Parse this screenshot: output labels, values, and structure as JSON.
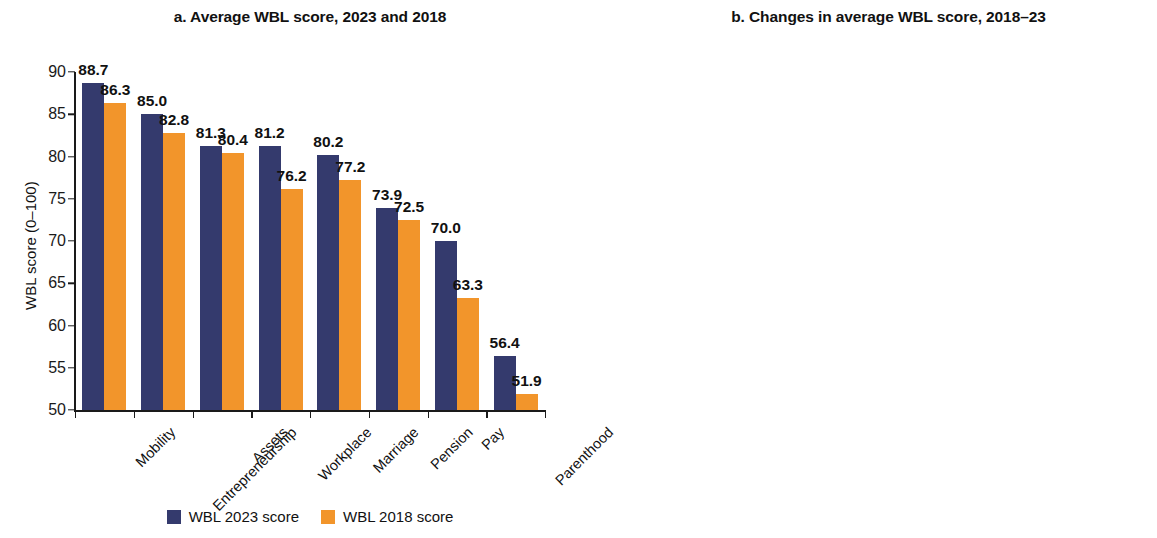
{
  "figure": {
    "background": "#ffffff",
    "colors": {
      "navy": "#343a6d",
      "orange": "#f2952b",
      "yellow": "#f8cb36",
      "text": "#111111"
    }
  },
  "panel_a": {
    "title": "a. Average WBL score, 2023 and 2018",
    "legend": [
      {
        "label": "WBL 2023 score",
        "color": "#343a6d"
      },
      {
        "label": "WBL 2018 score",
        "color": "#f2952b"
      }
    ]
  },
  "panel_b": {
    "title": "b. Changes in average WBL score, 2018–23"
  },
  "chart_data": [
    {
      "type": "bar",
      "title": "a. Average WBL score, 2023 and 2018",
      "xlabel": "",
      "ylabel": "WBL score (0–100)",
      "ylim": [
        50,
        90
      ],
      "yticks": [
        50,
        55,
        60,
        65,
        70,
        75,
        80,
        85,
        90
      ],
      "ytick_labels": [
        "50",
        "55",
        "60",
        "65",
        "70",
        "75",
        "80",
        "85",
        "90"
      ],
      "grid": false,
      "legend_position": "bottom-center",
      "categories": [
        "Mobility",
        "Entrepreneurship",
        "Assets",
        "Workplace",
        "Marriage",
        "Pension",
        "Pay",
        "Parenthood"
      ],
      "series": [
        {
          "name": "WBL 2023 score",
          "color": "#343a6d",
          "values": [
            88.7,
            85.0,
            81.3,
            81.2,
            80.2,
            73.9,
            70.0,
            56.4
          ],
          "labels": [
            "88.7",
            "85.0",
            "81.3",
            "81.2",
            "80.2",
            "73.9",
            "70.0",
            "56.4"
          ]
        },
        {
          "name": "WBL 2018 score",
          "color": "#f2952b",
          "values": [
            86.3,
            82.8,
            80.4,
            76.2,
            77.2,
            72.5,
            63.3,
            51.9
          ],
          "labels": [
            "86.3",
            "82.8",
            "80.4",
            "76.2",
            "77.2",
            "72.5",
            "63.3",
            "51.9"
          ]
        }
      ]
    },
    {
      "type": "bar",
      "title": "b. Changes in average WBL score, 2018–23",
      "xlabel": "",
      "ylabel": "Changes compared with WBL 2018 score",
      "ylim": [
        0,
        7
      ],
      "yticks": [
        0,
        1,
        2,
        3,
        4,
        5,
        6,
        7
      ],
      "ytick_labels": [
        "0",
        "1",
        "2",
        "3",
        "4",
        "5",
        "6",
        "7"
      ],
      "grid": false,
      "legend_position": "none",
      "categories": [
        "Pay",
        "Workplace",
        "Parenthood",
        "Marriage",
        "Mobility",
        "Entrepreneurship",
        "Pension",
        "Assets"
      ],
      "series": [
        {
          "name": "Change 2018–23",
          "color": "#f8cb36",
          "values": [
            6.7,
            5.0,
            4.5,
            3.0,
            2.4,
            2.2,
            1.4,
            0.9
          ],
          "labels": [
            "6.7",
            "5.0",
            "4.5",
            "3.0",
            "2.4",
            "2.2",
            "1.4",
            "0.9"
          ]
        }
      ]
    }
  ]
}
